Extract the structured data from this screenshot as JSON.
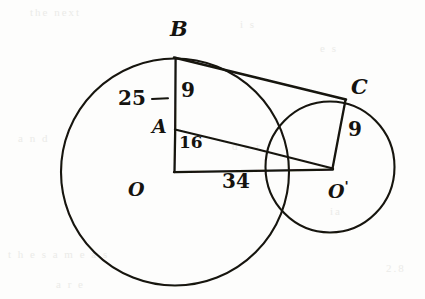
{
  "figure": {
    "type": "geometry-diagram",
    "medium": "hand-drawn pencil sketch on paper",
    "ink_color": "#15130f",
    "paper_color": "#fdfdfc"
  },
  "points": [
    {
      "id": "B",
      "label": "B",
      "x": 175,
      "y": 58,
      "label_x": 170,
      "label_y": 18,
      "desc": "tangent point on large circle"
    },
    {
      "id": "A",
      "label": "A",
      "x": 175,
      "y": 130,
      "label_x": 152,
      "label_y": 118,
      "desc": "point on radius OB at distance 16 from O"
    },
    {
      "id": "C",
      "label": "C",
      "x": 345,
      "y": 100,
      "label_x": 352,
      "label_y": 78,
      "desc": "tangent point on small circle"
    },
    {
      "id": "O",
      "label": "O",
      "x": 175,
      "y": 172,
      "label_x": 128,
      "label_y": 180,
      "desc": "center of large circle"
    },
    {
      "id": "O1",
      "label": "O",
      "prime": "'",
      "x": 330,
      "y": 167,
      "label_x": 330,
      "label_y": 180,
      "desc": "center of small circle"
    }
  ],
  "circles": [
    {
      "id": "large-circle",
      "center": "O",
      "cx": 175,
      "cy": 172,
      "r": 114,
      "radius_label": "25"
    },
    {
      "id": "small-circle",
      "center": "O'",
      "cx": 330,
      "cy": 167,
      "r": 65,
      "radius_label": "9"
    }
  ],
  "segments": [
    {
      "id": "OB",
      "from": "O",
      "to": "B",
      "x1": 175,
      "y1": 172,
      "x2": 175,
      "y2": 58,
      "desc": "radius of large circle, perpendicular to tangent"
    },
    {
      "id": "BC",
      "from": "B",
      "to": "C",
      "x1": 175,
      "y1": 58,
      "x2": 345,
      "y2": 100,
      "desc": "common external tangent"
    },
    {
      "id": "AO1",
      "from": "A",
      "to": "O1",
      "x1": 175,
      "y1": 130,
      "x2": 332,
      "y2": 168,
      "desc": "line parallel to tangent BC"
    },
    {
      "id": "OO1",
      "from": "O",
      "to": "O1",
      "x1": 175,
      "y1": 172,
      "x2": 332,
      "y2": 169,
      "desc": "line of centers"
    },
    {
      "id": "CO1",
      "from": "C",
      "to": "O1",
      "x1": 345,
      "y1": 100,
      "x2": 332,
      "y2": 168,
      "desc": "radius of small circle, perpendicular to tangent"
    }
  ],
  "measurements": [
    {
      "id": "m25",
      "value": "25",
      "on": "OB",
      "x": 120,
      "y": 98,
      "desc": "radius of large circle (with leader dash)",
      "leader": true
    },
    {
      "id": "m9b",
      "value": "9",
      "on": "BA",
      "x": 182,
      "y": 88,
      "desc": "segment BA = difference of radii"
    },
    {
      "id": "m16",
      "value": "16",
      "on": "AO",
      "x": 180,
      "y": 140,
      "desc": "segment AO"
    },
    {
      "id": "m34",
      "value": "34",
      "on": "OO1",
      "x": 228,
      "y": 180,
      "desc": "distance between centers"
    },
    {
      "id": "m9c",
      "value": "9",
      "on": "CO1",
      "x": 350,
      "y": 128,
      "desc": "radius of small circle"
    }
  ],
  "ghost_marks": [
    {
      "text": "the next",
      "x": 30,
      "y": 6
    },
    {
      "text": "i  s",
      "x": 240,
      "y": 18
    },
    {
      "text": "e  s",
      "x": 320,
      "y": 42
    },
    {
      "text": "a  n  d",
      "x": 18,
      "y": 132
    },
    {
      "text": "d  e  r",
      "x": 232,
      "y": 140
    },
    {
      "text": "ia",
      "x": 330,
      "y": 205
    },
    {
      "text": "t h e   s a m e   a s",
      "x": 8,
      "y": 248
    },
    {
      "text": "2.8",
      "x": 386,
      "y": 262
    },
    {
      "text": "a  r  e",
      "x": 56,
      "y": 278
    }
  ]
}
